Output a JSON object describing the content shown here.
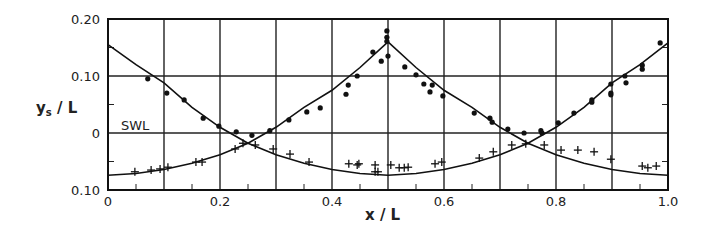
{
  "chart_data": {
    "type": "scatter",
    "title": "",
    "xlabel": "x / L",
    "ylabel": "y_s / L",
    "xlim": [
      0,
      1.0
    ],
    "ylim": [
      -0.1,
      0.2
    ],
    "grid": true,
    "x_ticks": [
      {
        "value": 0,
        "label": "0"
      },
      {
        "value": 0.2,
        "label": "0.2"
      },
      {
        "value": 0.4,
        "label": "0.4"
      },
      {
        "value": 0.6,
        "label": "0.6"
      },
      {
        "value": 0.8,
        "label": "0.8"
      },
      {
        "value": 1.0,
        "label": "1.0"
      }
    ],
    "y_ticks": [
      {
        "value": 0.2,
        "label": "0.20"
      },
      {
        "value": 0.1,
        "label": "0.10"
      },
      {
        "value": 0,
        "label": "0"
      },
      {
        "value": -0.1,
        "label": "0.10"
      }
    ],
    "x_gridlines": [
      0.1,
      0.2,
      0.3,
      0.4,
      0.5,
      0.6,
      0.7,
      0.8,
      0.9
    ],
    "y_gridlines": [
      0.1,
      0.0
    ],
    "annotations": [
      {
        "text": "SWL",
        "x": 0.02,
        "y": 0.012
      }
    ],
    "series": [
      {
        "name": "measured (dots)",
        "marker": "dot",
        "points": [
          [
            0.071,
            0.095
          ],
          [
            0.105,
            0.07
          ],
          [
            0.136,
            0.058
          ],
          [
            0.17,
            0.026
          ],
          [
            0.198,
            0.012
          ],
          [
            0.229,
            0.002
          ],
          [
            0.257,
            -0.004
          ],
          [
            0.289,
            0.004
          ],
          [
            0.323,
            0.023
          ],
          [
            0.355,
            0.037
          ],
          [
            0.379,
            0.044
          ],
          [
            0.425,
            0.068
          ],
          [
            0.429,
            0.084
          ],
          [
            0.445,
            0.1
          ],
          [
            0.473,
            0.142
          ],
          [
            0.488,
            0.126
          ],
          [
            0.498,
            0.179
          ],
          [
            0.498,
            0.168
          ],
          [
            0.498,
            0.161
          ],
          [
            0.5,
            0.135
          ],
          [
            0.53,
            0.116
          ],
          [
            0.55,
            0.102
          ],
          [
            0.564,
            0.086
          ],
          [
            0.575,
            0.072
          ],
          [
            0.579,
            0.084
          ],
          [
            0.598,
            0.065
          ],
          [
            0.654,
            0.035
          ],
          [
            0.682,
            0.026
          ],
          [
            0.686,
            0.019
          ],
          [
            0.714,
            0.007
          ],
          [
            0.743,
            0.0
          ],
          [
            0.773,
            0.004
          ],
          [
            0.775,
            0.0
          ],
          [
            0.804,
            0.018
          ],
          [
            0.832,
            0.035
          ],
          [
            0.864,
            0.058
          ],
          [
            0.864,
            0.054
          ],
          [
            0.898,
            0.086
          ],
          [
            0.898,
            0.07
          ],
          [
            0.898,
            0.067
          ],
          [
            0.923,
            0.1
          ],
          [
            0.925,
            0.088
          ],
          [
            0.954,
            0.119
          ],
          [
            0.954,
            0.112
          ],
          [
            0.986,
            0.158
          ]
        ]
      },
      {
        "name": "measured (crosses)",
        "marker": "cross",
        "points": [
          [
            0.048,
            -0.068
          ],
          [
            0.077,
            -0.065
          ],
          [
            0.093,
            -0.063
          ],
          [
            0.107,
            -0.06
          ],
          [
            0.157,
            -0.051
          ],
          [
            0.168,
            -0.051
          ],
          [
            0.227,
            -0.028
          ],
          [
            0.241,
            -0.018
          ],
          [
            0.263,
            -0.021
          ],
          [
            0.295,
            -0.028
          ],
          [
            0.325,
            -0.037
          ],
          [
            0.359,
            -0.051
          ],
          [
            0.43,
            -0.054
          ],
          [
            0.445,
            -0.056
          ],
          [
            0.448,
            -0.054
          ],
          [
            0.477,
            -0.056
          ],
          [
            0.477,
            -0.068
          ],
          [
            0.482,
            -0.068
          ],
          [
            0.505,
            -0.056
          ],
          [
            0.52,
            -0.061
          ],
          [
            0.529,
            -0.061
          ],
          [
            0.536,
            -0.06
          ],
          [
            0.584,
            -0.054
          ],
          [
            0.596,
            -0.051
          ],
          [
            0.663,
            -0.044
          ],
          [
            0.688,
            -0.033
          ],
          [
            0.721,
            -0.021
          ],
          [
            0.746,
            -0.019
          ],
          [
            0.779,
            -0.021
          ],
          [
            0.809,
            -0.03
          ],
          [
            0.839,
            -0.03
          ],
          [
            0.868,
            -0.033
          ],
          [
            0.898,
            -0.046
          ],
          [
            0.954,
            -0.058
          ],
          [
            0.964,
            -0.061
          ],
          [
            0.979,
            -0.058
          ]
        ]
      },
      {
        "name": "theory curve A (trough at 0.5)",
        "marker": "line",
        "points": [
          [
            0,
            0.155
          ],
          [
            0.05,
            0.12
          ],
          [
            0.1,
            0.088
          ],
          [
            0.15,
            0.045
          ],
          [
            0.2,
            0.01
          ],
          [
            0.25,
            -0.018
          ],
          [
            0.3,
            -0.038
          ],
          [
            0.35,
            -0.053
          ],
          [
            0.4,
            -0.064
          ],
          [
            0.45,
            -0.071
          ],
          [
            0.5,
            -0.074
          ],
          [
            0.55,
            -0.071
          ],
          [
            0.6,
            -0.064
          ],
          [
            0.65,
            -0.053
          ],
          [
            0.7,
            -0.038
          ],
          [
            0.75,
            -0.018
          ],
          [
            0.8,
            0.01
          ],
          [
            0.85,
            0.045
          ],
          [
            0.9,
            0.088
          ],
          [
            0.95,
            0.12
          ],
          [
            1.0,
            0.158
          ]
        ]
      },
      {
        "name": "theory curve B (crest at 0.5)",
        "marker": "line",
        "points": [
          [
            0,
            -0.074
          ],
          [
            0.05,
            -0.071
          ],
          [
            0.1,
            -0.064
          ],
          [
            0.15,
            -0.053
          ],
          [
            0.2,
            -0.038
          ],
          [
            0.25,
            -0.018
          ],
          [
            0.3,
            0.01
          ],
          [
            0.35,
            0.045
          ],
          [
            0.4,
            0.075
          ],
          [
            0.45,
            0.115
          ],
          [
            0.5,
            0.16
          ],
          [
            0.55,
            0.115
          ],
          [
            0.6,
            0.075
          ],
          [
            0.65,
            0.045
          ],
          [
            0.7,
            0.01
          ],
          [
            0.75,
            -0.018
          ],
          [
            0.8,
            -0.038
          ],
          [
            0.85,
            -0.053
          ],
          [
            0.9,
            -0.064
          ],
          [
            0.95,
            -0.071
          ],
          [
            1.0,
            -0.074
          ]
        ]
      }
    ]
  }
}
